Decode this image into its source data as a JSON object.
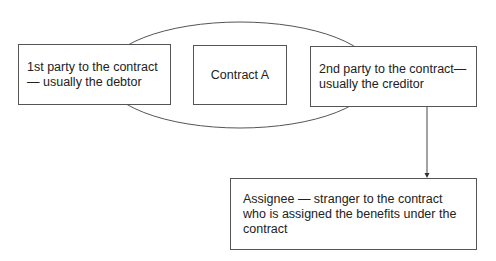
{
  "diagram": {
    "type": "contract-assignment",
    "nodes": [
      {
        "id": "first-party",
        "label": "1st party to the contract— usually the debtor"
      },
      {
        "id": "contract",
        "label": "Contract A"
      },
      {
        "id": "second-party",
        "label": "2nd party to the contract— usually the creditor"
      },
      {
        "id": "assignee",
        "label": "Assignee — stranger to the contract who is assigned the benefits under the contract"
      }
    ],
    "edges": [
      {
        "from": "second-party",
        "to": "assignee",
        "style": "arrow"
      }
    ],
    "groups": [
      {
        "shape": "ellipse",
        "contains": [
          "first-party",
          "contract",
          "second-party"
        ]
      }
    ]
  }
}
